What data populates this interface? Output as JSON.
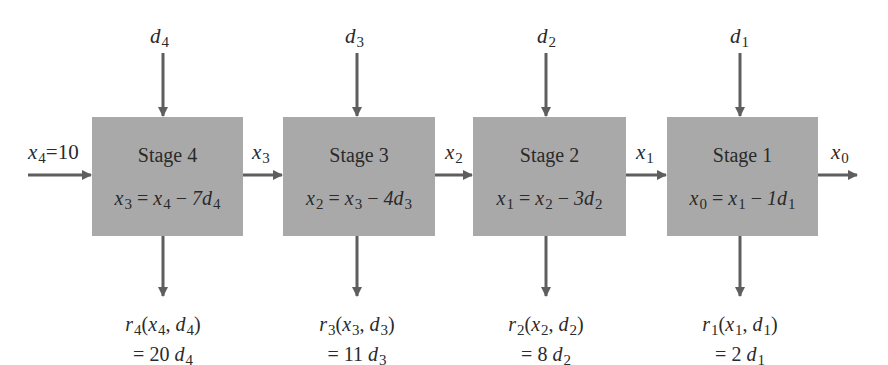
{
  "diagram": {
    "type": "serial multistage decision process",
    "initial_state": {
      "var": "x",
      "sub": "4",
      "value": "=10"
    },
    "final_state": {
      "var": "x",
      "sub": "0"
    },
    "stages": [
      {
        "title": "Stage 4",
        "decision": {
          "var": "d",
          "sub": "4"
        },
        "output_state": {
          "var": "x",
          "sub": "3"
        },
        "equation": {
          "lhs": "x",
          "lhs_sub": "3",
          "rhs_var": "x",
          "rhs_sub": "4",
          "op": " − ",
          "coef": "7",
          "d": "d",
          "d_sub": "4"
        },
        "return": {
          "r_sub": "4",
          "args": [
            "x",
            "4",
            "d",
            "4"
          ],
          "value_prefix": "= 20 ",
          "value_sub": "4"
        }
      },
      {
        "title": "Stage 3",
        "decision": {
          "var": "d",
          "sub": "3"
        },
        "output_state": {
          "var": "x",
          "sub": "2"
        },
        "equation": {
          "lhs": "x",
          "lhs_sub": "2",
          "rhs_var": "x",
          "rhs_sub": "3",
          "op": " − ",
          "coef": "4",
          "d": "d",
          "d_sub": "3"
        },
        "return": {
          "r_sub": "3",
          "args": [
            "x",
            "3",
            "d",
            "3"
          ],
          "value_prefix": "= 11 ",
          "value_sub": "3"
        }
      },
      {
        "title": "Stage 2",
        "decision": {
          "var": "d",
          "sub": "2"
        },
        "output_state": {
          "var": "x",
          "sub": "1"
        },
        "equation": {
          "lhs": "x",
          "lhs_sub": "1",
          "rhs_var": "x",
          "rhs_sub": "2",
          "op": " − ",
          "coef": "3",
          "d": "d",
          "d_sub": "2"
        },
        "return": {
          "r_sub": "2",
          "args": [
            "x",
            "2",
            "d",
            "2"
          ],
          "value_prefix": "= 8 ",
          "value_sub": "2"
        }
      },
      {
        "title": "Stage 1",
        "decision": {
          "var": "d",
          "sub": "1"
        },
        "output_state": {
          "var": "x",
          "sub": "0"
        },
        "equation": {
          "lhs": "x",
          "lhs_sub": "0",
          "rhs_var": "x",
          "rhs_sub": "1",
          "op": " − ",
          "coef": "1",
          "d": "d",
          "d_sub": "1"
        },
        "return": {
          "r_sub": "1",
          "args": [
            "x",
            "1",
            "d",
            "1"
          ],
          "value_prefix": "= 2 ",
          "value_sub": "1"
        }
      }
    ],
    "colors": {
      "box_fill": "#a9a9a9",
      "arrow": "#5e5e5e",
      "text": "#2a2a2a"
    }
  }
}
